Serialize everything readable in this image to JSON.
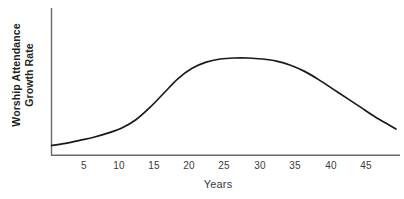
{
  "chart_data": {
    "type": "line",
    "title": "",
    "subtitle": "",
    "xlabel": "Years",
    "ylabel_lines": [
      "Worship Attendance",
      "Growth Rate"
    ],
    "ylabel": "Worship Attendance Growth Rate",
    "xticks": [
      "5",
      "10",
      "15",
      "20",
      "25",
      "30",
      "35",
      "40",
      "45"
    ],
    "xtick_values": [
      5,
      10,
      15,
      20,
      25,
      30,
      35,
      40,
      45
    ],
    "yticks": [],
    "xlim": [
      0,
      49
    ],
    "ylim": [
      0,
      1
    ],
    "grid": false,
    "legend": null,
    "annotations": [],
    "series": [
      {
        "name": "Worship Attendance Growth Rate",
        "color": "#1a1a1a",
        "line_width": 1.7,
        "x": [
          0,
          2,
          4,
          6,
          8,
          10,
          12,
          14,
          16,
          18,
          20,
          22,
          24,
          26,
          28,
          30,
          32,
          34,
          36,
          38,
          40,
          42,
          44,
          46,
          48,
          49
        ],
        "y": [
          0.07,
          0.09,
          0.12,
          0.15,
          0.19,
          0.24,
          0.32,
          0.44,
          0.58,
          0.72,
          0.82,
          0.88,
          0.91,
          0.92,
          0.92,
          0.91,
          0.89,
          0.85,
          0.79,
          0.71,
          0.62,
          0.53,
          0.44,
          0.35,
          0.27,
          0.23
        ]
      }
    ],
    "axis_color": "#6a6a6a",
    "background": "#ffffff"
  },
  "axes": {
    "x_axis_label": "Years",
    "y_axis_label_line1": "Worship Attendance",
    "y_axis_label_line2": "Growth Rate"
  },
  "ticks": {
    "x": [
      {
        "label": "5"
      },
      {
        "label": "10"
      },
      {
        "label": "15"
      },
      {
        "label": "20"
      },
      {
        "label": "25"
      },
      {
        "label": "30"
      },
      {
        "label": "35"
      },
      {
        "label": "40"
      },
      {
        "label": "45"
      }
    ]
  }
}
